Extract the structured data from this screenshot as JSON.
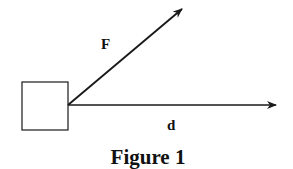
{
  "figure": {
    "caption": "Figure 1",
    "labels": {
      "force": "F",
      "displacement": "d"
    },
    "colors": {
      "stroke": "#1a1a1a",
      "background": "#ffffff"
    }
  }
}
